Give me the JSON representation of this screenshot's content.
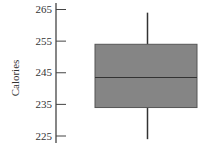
{
  "chart_data": {
    "type": "box",
    "title": "",
    "xlabel": "",
    "ylabel": "Calories",
    "ylim": [
      223,
      266
    ],
    "yticks": [
      225,
      235,
      245,
      255,
      265
    ],
    "grid": false,
    "legend": null,
    "series": [
      {
        "name": "Calories",
        "whisker_low": 224,
        "q1": 234,
        "median": 243.5,
        "q3": 254,
        "whisker_high": 264
      }
    ],
    "colors": {
      "box_fill": "#858585",
      "box_edge": "#555555",
      "axis": "#444444",
      "whisker": "#333333"
    }
  }
}
